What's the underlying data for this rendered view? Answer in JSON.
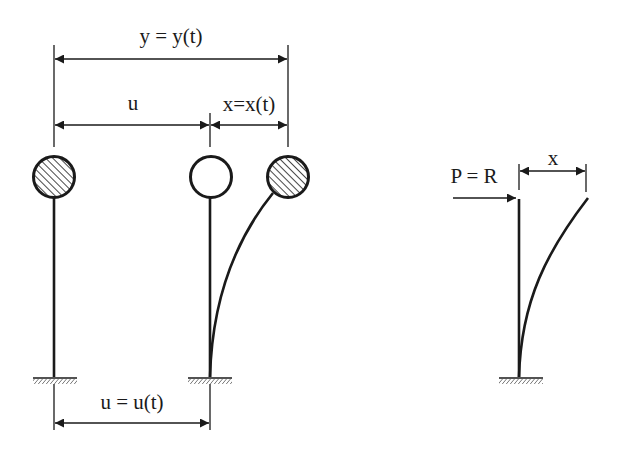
{
  "diagram": {
    "type": "structural-dynamics-sdof",
    "labels": {
      "total_displacement": "y = y(t)",
      "ground_offset": "u",
      "relative_displacement": "x=x(t)",
      "ground_displacement": "u = u(t)",
      "force": "P = R",
      "deflection": "x"
    },
    "elements": [
      {
        "id": "mass-original",
        "fill": "hatched",
        "x": 54
      },
      {
        "id": "mass-reference",
        "fill": "empty",
        "x": 211
      },
      {
        "id": "mass-displaced",
        "fill": "hatched",
        "x": 288
      },
      {
        "id": "equivalent-static-column",
        "x": 519
      }
    ],
    "colors": {
      "ink": "#1a1a1a",
      "background": "#ffffff"
    }
  }
}
